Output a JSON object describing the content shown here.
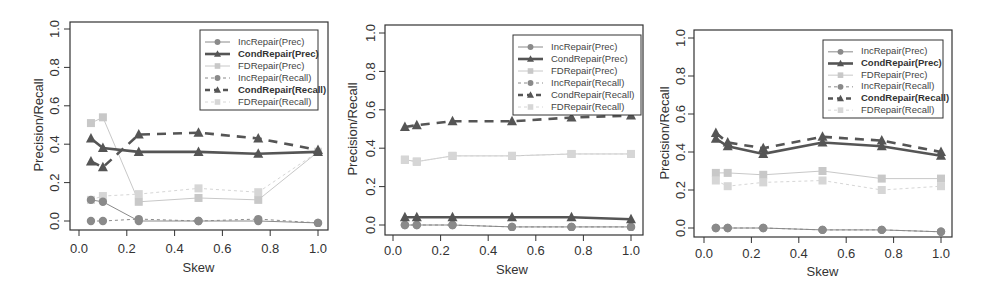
{
  "chart_data": [
    {
      "type": "line",
      "title": "",
      "xlabel": "Skew",
      "ylabel": "Precision/Recall",
      "xlim": [
        0.0,
        1.0
      ],
      "ylim": [
        0.0,
        1.0
      ],
      "xticks": [
        "0.0",
        "0.2",
        "0.4",
        "0.6",
        "0.8",
        "1.0"
      ],
      "yticks": [
        "0.0",
        "0.2",
        "0.4",
        "0.6",
        "0.8",
        "1.0"
      ],
      "grid": false,
      "legend_position": "top-right",
      "x": [
        0.05,
        0.1,
        0.25,
        0.5,
        0.75,
        1.0
      ],
      "series": [
        {
          "name": "IncRepair(Prec)",
          "values": [
            0.11,
            0.1,
            0.0,
            0.0,
            0.0,
            -0.01
          ]
        },
        {
          "name": "CondRepair(Prec)",
          "values": [
            0.43,
            0.38,
            0.36,
            0.36,
            0.35,
            0.36
          ]
        },
        {
          "name": "FDRepair(Prec)",
          "values": [
            0.51,
            0.54,
            0.1,
            0.12,
            0.11,
            0.36
          ]
        },
        {
          "name": "IncRepair(Recall)",
          "values": [
            0.0,
            0.0,
            0.01,
            0.0,
            0.01,
            -0.01
          ]
        },
        {
          "name": "CondRepair(Recall)",
          "values": [
            0.31,
            0.28,
            0.45,
            0.46,
            0.43,
            0.37
          ]
        },
        {
          "name": "FDRepair(Recall)",
          "values": [
            0.11,
            0.13,
            0.14,
            0.17,
            0.15,
            0.36
          ]
        }
      ]
    },
    {
      "type": "line",
      "title": "",
      "xlabel": "Skew",
      "ylabel": "Precision/Recall",
      "xlim": [
        0.0,
        1.0
      ],
      "ylim": [
        0.0,
        1.0
      ],
      "xticks": [
        "0.0",
        "0.2",
        "0.4",
        "0.6",
        "0.8",
        "1.0"
      ],
      "yticks": [
        "0.0",
        "0.2",
        "0.4",
        "0.6",
        "0.8",
        "1.0"
      ],
      "grid": false,
      "legend_position": "top-right",
      "x": [
        0.05,
        0.1,
        0.25,
        0.5,
        0.75,
        1.0
      ],
      "series": [
        {
          "name": "IncRepair(Prec)",
          "values": [
            0.0,
            0.0,
            0.0,
            -0.01,
            -0.01,
            -0.01
          ]
        },
        {
          "name": "CondRepair(Prec)",
          "values": [
            0.04,
            0.04,
            0.04,
            0.04,
            0.04,
            0.03
          ]
        },
        {
          "name": "FDRepair(Prec)",
          "values": [
            0.34,
            0.33,
            0.36,
            0.36,
            0.37,
            0.37
          ]
        },
        {
          "name": "IncRepair(Recall)",
          "values": [
            0.0,
            0.0,
            0.0,
            -0.01,
            -0.01,
            -0.01
          ]
        },
        {
          "name": "CondRepair(Recall)",
          "values": [
            0.51,
            0.52,
            0.54,
            0.54,
            0.56,
            0.57
          ]
        },
        {
          "name": "FDRepair(Recall)",
          "values": [
            0.34,
            0.33,
            0.36,
            0.36,
            0.37,
            0.37
          ]
        }
      ]
    },
    {
      "type": "line",
      "title": "",
      "xlabel": "Skew",
      "ylabel": "Precision/Recall",
      "xlim": [
        0.0,
        1.0
      ],
      "ylim": [
        0.0,
        1.0
      ],
      "xticks": [
        "0.0",
        "0.2",
        "0.4",
        "0.6",
        "0.8",
        "1.0"
      ],
      "yticks": [
        "0.0",
        "0.2",
        "0.4",
        "0.6",
        "0.8",
        "1.0"
      ],
      "grid": false,
      "legend_position": "top-right",
      "x": [
        0.05,
        0.1,
        0.25,
        0.5,
        0.75,
        1.0
      ],
      "series": [
        {
          "name": "IncRepair(Prec)",
          "values": [
            0.0,
            0.0,
            0.0,
            -0.01,
            -0.01,
            -0.02
          ]
        },
        {
          "name": "CondRepair(Prec)",
          "values": [
            0.47,
            0.43,
            0.39,
            0.45,
            0.43,
            0.38
          ]
        },
        {
          "name": "FDRepair(Prec)",
          "values": [
            0.29,
            0.29,
            0.28,
            0.3,
            0.26,
            0.26
          ]
        },
        {
          "name": "IncRepair(Recall)",
          "values": [
            0.0,
            0.0,
            0.0,
            -0.01,
            -0.01,
            -0.02
          ]
        },
        {
          "name": "CondRepair(Recall)",
          "values": [
            0.5,
            0.45,
            0.42,
            0.48,
            0.46,
            0.4
          ]
        },
        {
          "name": "FDRepair(Recall)",
          "values": [
            0.25,
            0.22,
            0.24,
            0.25,
            0.2,
            0.22
          ]
        }
      ]
    }
  ],
  "style": {
    "series_colors": [
      "#8a8a8a",
      "#555555",
      "#c8c8c8",
      "#8a8a8a",
      "#555555",
      "#d6d6d6"
    ],
    "axis_color": "#333333",
    "background": "#ffffff"
  }
}
